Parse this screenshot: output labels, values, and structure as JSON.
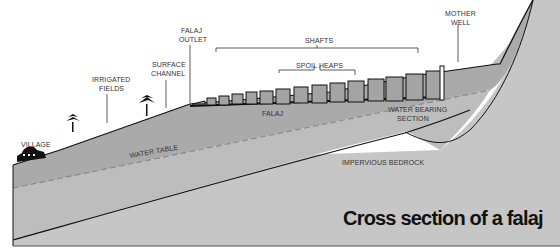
{
  "diagram": {
    "title": "Cross section of a falaj",
    "labels": {
      "village": "VILLAGE",
      "irrigated_fields_1": "IRRIGATED",
      "irrigated_fields_2": "FIELDS",
      "surface_channel_1": "SURFACE",
      "surface_channel_2": "CHANNEL",
      "falaj_outlet_1": "FALAJ",
      "falaj_outlet_2": "OUTLET",
      "shafts": "SHAFTS",
      "spoil_heaps": "SPOIL HEAPS",
      "mother_well_1": "MOTHER",
      "mother_well_2": "WELL",
      "falaj": "FALAJ",
      "water_bearing_1": "WATER BEARING",
      "water_bearing_2": "SECTION",
      "water_table": "WATER TABLE",
      "impervious_bedrock": "IMPERVIOUS BEDROCK"
    },
    "colors": {
      "saturated_layer": "#a9a9a9",
      "bedrock": "#c4c4c4",
      "upper_soil": "#b5b5b5",
      "outline": "#111111",
      "water_table_dash": "#8a8a8a"
    }
  }
}
